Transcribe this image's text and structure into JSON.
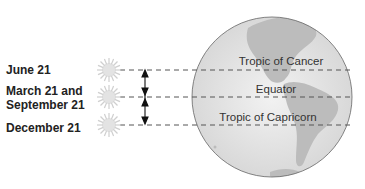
{
  "dates": {
    "june": "June 21",
    "march_line1": "March 21 and",
    "march_line2": "September 21",
    "december": "December 21"
  },
  "latitudes": {
    "cancer": "Tropic of Cancer",
    "equator": "Equator",
    "capricorn": "Tropic of Capricorn"
  },
  "colors": {
    "globe_fill": "#e4e4e4",
    "land_fill": "#bdbdbd",
    "sun_fill": "#e0e0e0",
    "line": "#555555"
  }
}
